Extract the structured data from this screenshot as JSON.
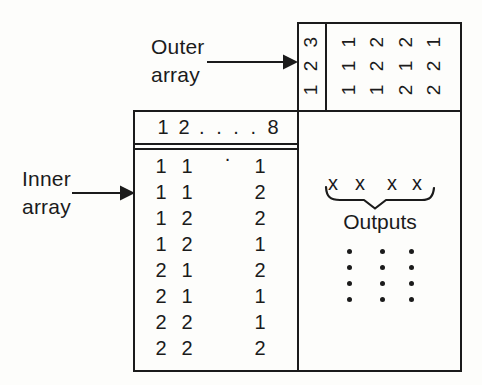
{
  "labels": {
    "outer_array": {
      "line1": "Outer",
      "line2": "array"
    },
    "inner_array": {
      "line1": "Inner",
      "line2": "array"
    }
  },
  "outer_array": {
    "row_header_rotated": "1 2 3",
    "runs_rotated": [
      "1 1 1",
      "1 2 2",
      "2 1 2",
      "2 2 1"
    ]
  },
  "inner_array": {
    "header": {
      "first": "1",
      "second": "2",
      "dots": ". . . . .",
      "last": "8"
    },
    "rows": [
      [
        "1",
        "1",
        "1"
      ],
      [
        "1",
        "1",
        "2"
      ],
      [
        "1",
        "2",
        "2"
      ],
      [
        "1",
        "2",
        "1"
      ],
      [
        "2",
        "1",
        "2"
      ],
      [
        "2",
        "1",
        "1"
      ],
      [
        "2",
        "2",
        "1"
      ],
      [
        "2",
        "2",
        "2"
      ]
    ]
  },
  "outputs": {
    "x_marks": [
      "x",
      "x",
      "x",
      "x"
    ],
    "label": "Outputs",
    "continuation_dots": {
      "columns": 3,
      "rows": 4
    }
  },
  "colors": {
    "ink": "#1b1b1b",
    "paper": "#fdfdfb"
  }
}
